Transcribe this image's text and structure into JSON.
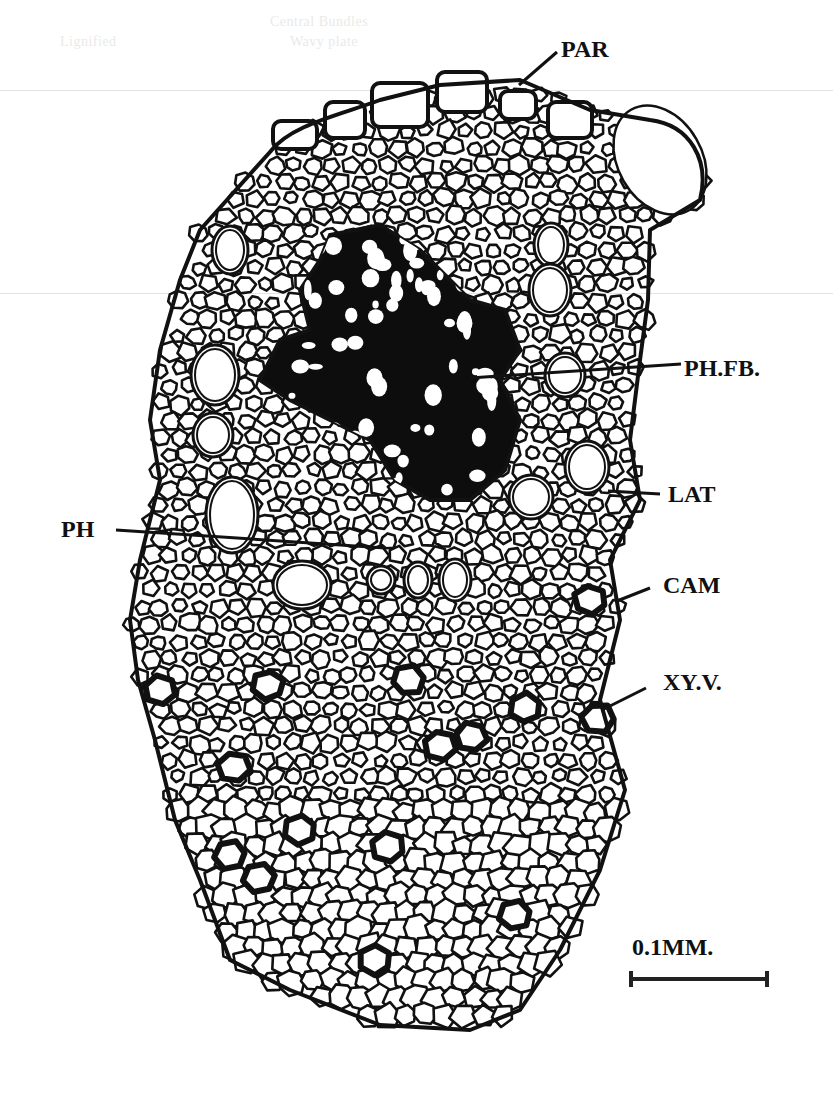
{
  "figure": {
    "type": "botanical-cross-section",
    "ink_color": "#111111",
    "background_color": "#ffffff",
    "fiber_bundle_color": "#0d0d0d"
  },
  "labels": [
    {
      "id": "par",
      "text": "PAR",
      "x": 561,
      "y": 37,
      "line": [
        [
          557,
          52
        ],
        [
          519,
          85
        ]
      ]
    },
    {
      "id": "ph-fb",
      "text": "PH.FB.",
      "x": 684,
      "y": 356,
      "line": [
        [
          681,
          364
        ],
        [
          470,
          378
        ]
      ]
    },
    {
      "id": "lat",
      "text": "LAT",
      "x": 668,
      "y": 482,
      "line": [
        [
          660,
          494
        ],
        [
          608,
          491
        ]
      ]
    },
    {
      "id": "ph",
      "text": "PH",
      "x": 61,
      "y": 517,
      "line": [
        [
          116,
          530
        ],
        [
          385,
          548
        ]
      ]
    },
    {
      "id": "cam",
      "text": "CAM",
      "x": 663,
      "y": 573,
      "line": [
        [
          650,
          588
        ],
        [
          617,
          601
        ]
      ]
    },
    {
      "id": "xy-v",
      "text": "XY.V.",
      "x": 663,
      "y": 670,
      "line": [
        [
          646,
          688
        ],
        [
          602,
          710
        ]
      ]
    }
  ],
  "scale_bar": {
    "label": "0.1MM.",
    "length_px": 140
  },
  "background_bleed": {
    "header_fragments": [
      "Central Bundles",
      "Wavy plate",
      "Lignified"
    ]
  }
}
